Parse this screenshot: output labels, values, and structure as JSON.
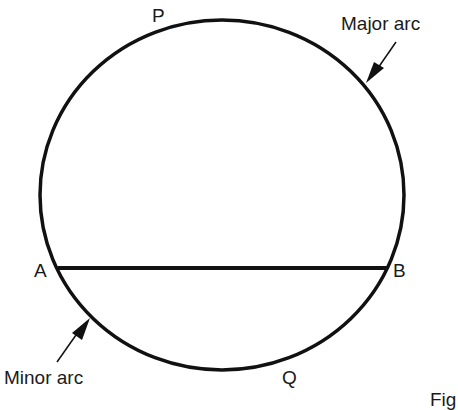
{
  "diagram": {
    "points": {
      "P": "P",
      "Q": "Q",
      "A": "A",
      "B": "B"
    },
    "labels": {
      "major_arc": "Major arc",
      "minor_arc": "Minor arc",
      "figure_caption": "Fig"
    },
    "stroke_color": "#111111"
  }
}
